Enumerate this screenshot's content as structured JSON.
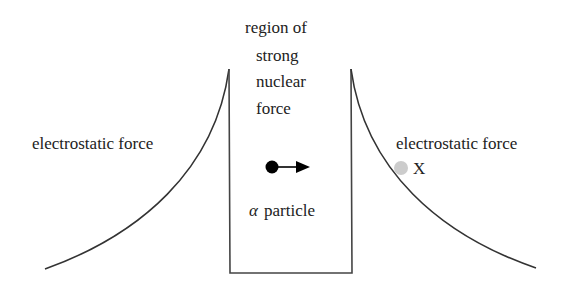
{
  "diagram": {
    "labels": {
      "left_force": "electrostatic force",
      "right_force": "electrostatic force",
      "center_line1": "region of",
      "center_line2": "strong",
      "center_line3": "nuclear",
      "center_line4": "force",
      "particle_symbol": "α",
      "particle_word": "particle",
      "point_x": "X"
    },
    "colors": {
      "line": "#333333",
      "particle": "#000000",
      "point_x": "#cccccc"
    }
  }
}
